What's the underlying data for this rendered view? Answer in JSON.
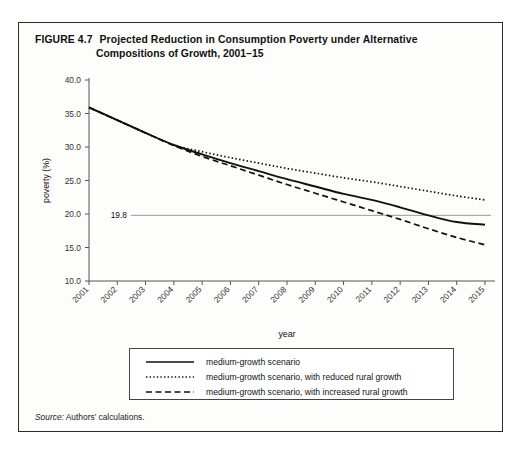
{
  "figure": {
    "number": "FIGURE 4.7",
    "title_line1": "Projected Reduction in Consumption Poverty under Alternative",
    "title_line2": "Compositions of Growth, 2001–15",
    "source_label": "Source:",
    "source_text": " Authors’ calculations."
  },
  "legend": {
    "items": [
      {
        "label": "medium-growth scenario",
        "style": "solid"
      },
      {
        "label": "medium-growth scenario, with reduced rural growth",
        "style": "dotted"
      },
      {
        "label": "medium-growth scenario, with increased rural growth",
        "style": "dashed"
      }
    ]
  },
  "chart_data": {
    "type": "line",
    "title": "Projected Reduction in Consumption Poverty under Alternative Compositions of Growth, 2001–15",
    "xlabel": "year",
    "ylabel": "poverty (%)",
    "xlim": [
      2001,
      2015
    ],
    "ylim": [
      10.0,
      40.0
    ],
    "ytick_labels": [
      "10.0",
      "15.0",
      "20.0",
      "25.0",
      "30.0",
      "35.0",
      "40.0"
    ],
    "ytick_values": [
      10.0,
      15.0,
      20.0,
      25.0,
      30.0,
      35.0,
      40.0
    ],
    "categories": [
      "2001",
      "2002",
      "2003",
      "2004",
      "2005",
      "2006",
      "2007",
      "2008",
      "2009",
      "2010",
      "2011",
      "2012",
      "2013",
      "2014",
      "2015"
    ],
    "grid": false,
    "legend_position": "below",
    "annotations": [
      {
        "name": "reference-line",
        "label": "19.8",
        "value": 19.8,
        "type": "horizontal-line"
      }
    ],
    "series": [
      {
        "name": "medium-growth scenario",
        "style": "solid",
        "values": [
          35.9,
          34.0,
          32.1,
          30.3,
          28.9,
          27.6,
          26.4,
          25.2,
          24.1,
          23.0,
          22.1,
          21.0,
          19.8,
          18.8,
          18.4
        ]
      },
      {
        "name": "medium-growth scenario, with reduced rural growth",
        "style": "dotted",
        "values": [
          35.9,
          34.0,
          32.1,
          30.3,
          29.3,
          28.4,
          27.6,
          26.8,
          26.1,
          25.4,
          24.8,
          24.1,
          23.4,
          22.7,
          22.1
        ]
      },
      {
        "name": "medium-growth scenario, with increased rural growth",
        "style": "dashed",
        "values": [
          35.9,
          34.0,
          32.1,
          30.2,
          28.6,
          27.2,
          25.8,
          24.4,
          23.1,
          21.8,
          20.5,
          19.2,
          17.8,
          16.5,
          15.4
        ]
      }
    ]
  }
}
